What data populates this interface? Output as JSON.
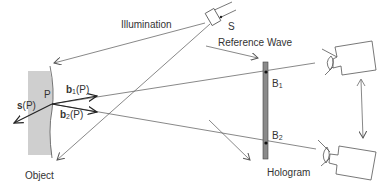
{
  "diagram": {
    "labels": {
      "illumination": "Illumination",
      "source": "S",
      "reference_wave": "Reference Wave",
      "point": "P",
      "object": "Object",
      "hologram": "Hologram",
      "b1_vec": "b",
      "b1_sub": "1",
      "b1_arg": "(P)",
      "b2_vec": "b",
      "b2_sub": "2",
      "b2_arg": "(P)",
      "s_vec": "s",
      "s_arg": "(P)",
      "B1_main": "B",
      "B1_sub": "1",
      "B2_main": "B",
      "B2_sub": "2"
    },
    "colors": {
      "line": "#555555",
      "object_fill": "#cfcfcf",
      "hologram_fill": "#8a8a8a",
      "text": "#333333"
    },
    "elements": [
      "light-source",
      "object-surface",
      "hologram-plate",
      "camera-top",
      "camera-bottom",
      "illumination-ray",
      "reference-wave-ray",
      "observation-ray-1",
      "observation-ray-2",
      "sensitivity-vector",
      "camera-move-arrow"
    ]
  }
}
